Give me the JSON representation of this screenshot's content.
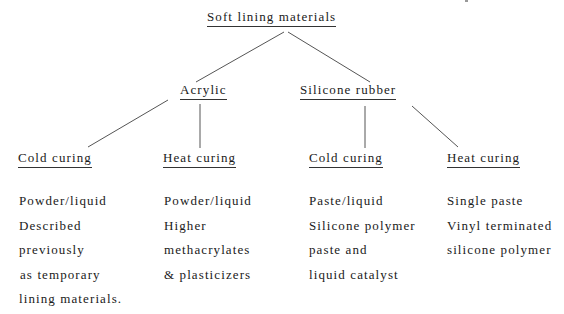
{
  "diagram": {
    "type": "tree",
    "root": {
      "label": "Soft lining materials",
      "children": [
        {
          "label": "Acrylic",
          "children": [
            {
              "label": "Cold curing",
              "description": [
                "Powder/liquid",
                "Described",
                "previously",
                "as temporary",
                "lining materials."
              ]
            },
            {
              "label": "Heat curing",
              "description": [
                "Powder/liquid",
                "Higher",
                "methacrylates",
                "& plasticizers"
              ]
            }
          ]
        },
        {
          "label": "Silicone rubber",
          "children": [
            {
              "label": "Cold curing",
              "description": [
                "Paste/liquid",
                "Silicone polymer",
                "paste and",
                "liquid catalyst"
              ]
            },
            {
              "label": "Heat curing",
              "description": [
                "Single paste",
                "Vinyl terminated",
                "silicone polymer"
              ]
            }
          ]
        }
      ]
    }
  },
  "colors": {
    "text": "#1a1a1a",
    "lines": "#555555",
    "background": "#ffffff"
  }
}
